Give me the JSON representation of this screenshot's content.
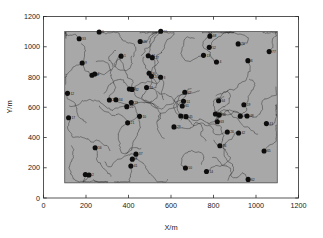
{
  "chart_data": {
    "type": "scatter",
    "title": "",
    "xlabel": "X/m",
    "ylabel": "Y/m",
    "xlim": [
      0,
      1200
    ],
    "ylim": [
      0,
      1200
    ],
    "xticks": [
      0,
      200,
      400,
      600,
      800,
      1000,
      1200
    ],
    "yticks": [
      0,
      200,
      400,
      600,
      800,
      1000,
      1200
    ],
    "grid": false,
    "legend": null,
    "region": {
      "name": "deployment-area",
      "x0": 100,
      "y0": 100,
      "x1": 1100,
      "y1": 1100,
      "fill_color": "#a8a8a8",
      "edge_color": "#3a3a3a"
    },
    "marker": {
      "shape": "circle",
      "color": "#0d0d0d",
      "size_px": 5.0
    },
    "trace": {
      "color": "#2a2a2a",
      "width_px": 0.45,
      "description": "random-walk mobility trajectory per node"
    },
    "nodes": [
      {
        "id": 33,
        "x": 168,
        "y": 1053,
        "label": "33"
      },
      {
        "id": 6,
        "x": 262,
        "y": 1098,
        "label": "6"
      },
      {
        "id": 46,
        "x": 455,
        "y": 1035,
        "label": "46"
      },
      {
        "id": 55,
        "x": 552,
        "y": 1102,
        "label": "55"
      },
      {
        "id": 68,
        "x": 783,
        "y": 1070,
        "label": "68"
      },
      {
        "id": 76,
        "x": 916,
        "y": 1019,
        "label": "76"
      },
      {
        "id": 9,
        "x": 182,
        "y": 893,
        "label": "9"
      },
      {
        "id": 1,
        "x": 365,
        "y": 938,
        "label": "1"
      },
      {
        "id": 44,
        "x": 493,
        "y": 940,
        "label": "44"
      },
      {
        "id": 27,
        "x": 512,
        "y": 928,
        "label": "27"
      },
      {
        "id": 13,
        "x": 753,
        "y": 943,
        "label": "13"
      },
      {
        "id": 52,
        "x": 780,
        "y": 996,
        "label": "52"
      },
      {
        "id": 77,
        "x": 1062,
        "y": 968,
        "label": "77"
      },
      {
        "id": 6,
        "x": 962,
        "y": 908,
        "label": "6"
      },
      {
        "id": 4,
        "x": 814,
        "y": 899,
        "label": "4"
      },
      {
        "id": 30,
        "x": 497,
        "y": 825,
        "label": "30"
      },
      {
        "id": 20,
        "x": 508,
        "y": 805,
        "label": "20"
      },
      {
        "id": 3,
        "x": 551,
        "y": 798,
        "label": "3"
      },
      {
        "id": 18,
        "x": 228,
        "y": 812,
        "label": "18"
      },
      {
        "id": 7,
        "x": 241,
        "y": 820,
        "label": "7"
      },
      {
        "id": 12,
        "x": 113,
        "y": 692,
        "label": "12"
      },
      {
        "id": 22,
        "x": 404,
        "y": 721,
        "label": "22"
      },
      {
        "id": 32,
        "x": 417,
        "y": 718,
        "label": "32"
      },
      {
        "id": 31,
        "x": 485,
        "y": 731,
        "label": "31"
      },
      {
        "id": 47,
        "x": 665,
        "y": 699,
        "label": "47"
      },
      {
        "id": 24,
        "x": 310,
        "y": 648,
        "label": "24"
      },
      {
        "id": 34,
        "x": 341,
        "y": 650,
        "label": "34"
      },
      {
        "id": 23,
        "x": 413,
        "y": 631,
        "label": "23"
      },
      {
        "id": 51,
        "x": 659,
        "y": 640,
        "label": "51"
      },
      {
        "id": 64,
        "x": 824,
        "y": 643,
        "label": "64"
      },
      {
        "id": 17,
        "x": 118,
        "y": 531,
        "label": "17"
      },
      {
        "id": 25,
        "x": 392,
        "y": 604,
        "label": "25"
      },
      {
        "id": 61,
        "x": 653,
        "y": 608,
        "label": "61"
      },
      {
        "id": 19,
        "x": 943,
        "y": 617,
        "label": "19"
      },
      {
        "id": 10,
        "x": 452,
        "y": 540,
        "label": "10"
      },
      {
        "id": 5,
        "x": 646,
        "y": 542,
        "label": "5"
      },
      {
        "id": 45,
        "x": 671,
        "y": 538,
        "label": "45"
      },
      {
        "id": 54,
        "x": 809,
        "y": 555,
        "label": "54"
      },
      {
        "id": 56,
        "x": 827,
        "y": 548,
        "label": "56"
      },
      {
        "id": 40,
        "x": 926,
        "y": 541,
        "label": "40"
      },
      {
        "id": 48,
        "x": 958,
        "y": 542,
        "label": "48"
      },
      {
        "id": 43,
        "x": 1049,
        "y": 492,
        "label": "43"
      },
      {
        "id": 21,
        "x": 396,
        "y": 497,
        "label": "21"
      },
      {
        "id": 63,
        "x": 818,
        "y": 504,
        "label": "63"
      },
      {
        "id": 29,
        "x": 614,
        "y": 470,
        "label": "29"
      },
      {
        "id": 26,
        "x": 865,
        "y": 436,
        "label": "26"
      },
      {
        "id": 42,
        "x": 918,
        "y": 430,
        "label": "42"
      },
      {
        "id": 36,
        "x": 830,
        "y": 345,
        "label": "36"
      },
      {
        "id": 16,
        "x": 243,
        "y": 332,
        "label": "16"
      },
      {
        "id": 37,
        "x": 435,
        "y": 290,
        "label": "37"
      },
      {
        "id": 65,
        "x": 1038,
        "y": 311,
        "label": "65"
      },
      {
        "id": 8,
        "x": 418,
        "y": 257,
        "label": "8"
      },
      {
        "id": 41,
        "x": 411,
        "y": 212,
        "label": "41"
      },
      {
        "id": 50,
        "x": 668,
        "y": 198,
        "label": "50"
      },
      {
        "id": 14,
        "x": 767,
        "y": 175,
        "label": "14"
      },
      {
        "id": 11,
        "x": 197,
        "y": 155,
        "label": "11"
      },
      {
        "id": 2,
        "x": 214,
        "y": 152,
        "label": "2"
      },
      {
        "id": 62,
        "x": 963,
        "y": 123,
        "label": "62"
      }
    ]
  },
  "axes": {
    "x_title": "X/m",
    "y_title": "Y/m",
    "x_tick_labels": [
      "0",
      "200",
      "400",
      "600",
      "800",
      "1000",
      "1200"
    ],
    "y_tick_labels": [
      "0",
      "200",
      "400",
      "600",
      "800",
      "1000",
      "1200"
    ]
  },
  "colors": {
    "background": "#ffffff",
    "region_fill": "#a8a8a8",
    "axis": "#2b2b2b",
    "marker": "#0d0d0d",
    "trace": "#2a2a2a"
  }
}
